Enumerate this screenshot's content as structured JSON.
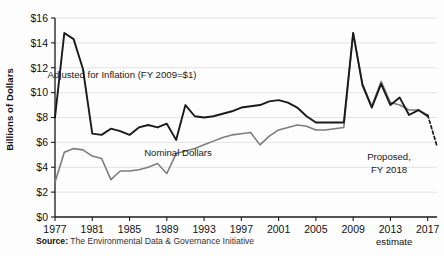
{
  "chart_data": {
    "type": "line",
    "title": "",
    "xlabel": "",
    "ylabel": "Billions of Dollars",
    "xlim": [
      1977,
      2018
    ],
    "ylim": [
      0,
      16
    ],
    "ytick_values": [
      0,
      2,
      4,
      6,
      8,
      10,
      12,
      14,
      16
    ],
    "ytick_labels": [
      "$0",
      "$2",
      "$4",
      "$6",
      "$8",
      "$10",
      "$12",
      "$14",
      "$16"
    ],
    "xtick_values": [
      1977,
      1981,
      1985,
      1989,
      1993,
      1997,
      2001,
      2005,
      2009,
      2013,
      2017
    ],
    "xtick_labels": [
      "1977",
      "1981",
      "1985",
      "1989",
      "1993",
      "1997",
      "2001",
      "2005",
      "2009",
      "2013",
      "2017"
    ],
    "grid": "horizontal",
    "legend_position": "inline-annotations",
    "x": [
      1977,
      1978,
      1979,
      1980,
      1981,
      1982,
      1983,
      1984,
      1985,
      1986,
      1987,
      1988,
      1989,
      1990,
      1991,
      1992,
      1993,
      1994,
      1995,
      1996,
      1997,
      1998,
      1999,
      2000,
      2001,
      2002,
      2003,
      2004,
      2005,
      2006,
      2007,
      2008,
      2009,
      2010,
      2011,
      2012,
      2013,
      2014,
      2015,
      2016,
      2017
    ],
    "series": [
      {
        "name": "Adjusted for Inflation (FY 2009=$1)",
        "color": "#1a1a1a",
        "values": [
          8.0,
          14.8,
          14.3,
          11.9,
          6.7,
          6.6,
          7.1,
          6.9,
          6.6,
          7.2,
          7.4,
          7.2,
          7.5,
          6.2,
          9.0,
          8.1,
          8.0,
          8.1,
          8.3,
          8.5,
          8.8,
          8.9,
          9.0,
          9.3,
          9.4,
          9.2,
          8.8,
          8.1,
          7.6,
          7.6,
          7.6,
          7.6,
          14.8,
          10.6,
          8.8,
          10.7,
          9.0,
          9.6,
          8.2,
          8.6,
          8.1
        ]
      },
      {
        "name": "Nominal Dollars",
        "color": "#7d7d7d",
        "values": [
          2.8,
          5.2,
          5.5,
          5.4,
          4.9,
          4.7,
          3.0,
          3.7,
          3.7,
          3.8,
          4.0,
          4.3,
          3.5,
          5.1,
          5.3,
          5.5,
          5.8,
          6.1,
          6.4,
          6.6,
          6.7,
          6.8,
          5.8,
          6.5,
          7.0,
          7.2,
          7.4,
          7.3,
          7.0,
          7.0,
          7.1,
          7.2,
          14.8,
          10.7,
          8.9,
          10.9,
          9.2,
          9.0,
          8.6,
          8.6,
          8.2
        ]
      }
    ],
    "projection": {
      "name": "Proposed, FY 2018",
      "style": "dashed",
      "from": {
        "x": 2017,
        "y": 8.2
      },
      "to": {
        "x": 2018,
        "y": 5.7
      }
    },
    "annotations": [
      {
        "text": "Adjusted for Inflation (FY 2009=$1)",
        "x": 122,
        "y": 78
      },
      {
        "text": "Nominal Dollars",
        "x": 178,
        "y": 156
      },
      {
        "text": "Proposed,",
        "x": 389,
        "y": 160
      },
      {
        "text": "FY 2018",
        "x": 389,
        "y": 173
      }
    ]
  },
  "footer": {
    "source_label": "Source:",
    "source_text": "The Environmental Data & Governance Initiative",
    "estimate_note": "estimate"
  }
}
